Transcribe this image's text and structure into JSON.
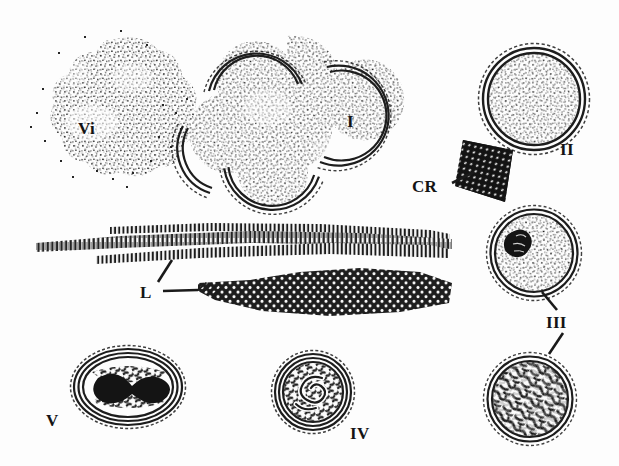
{
  "figure": {
    "background_color": "#fdfdfd",
    "ink_color": "#1a1a1a",
    "width": 619,
    "height": 466
  },
  "labels": {
    "vi": "Vi",
    "one": "I",
    "two": "II",
    "three": "III",
    "four": "IV",
    "five": "V",
    "cr": "CR",
    "l": "L"
  },
  "structures": [
    {
      "id": "vi-body",
      "label": "Vi",
      "kind": "stippled-irregular-mass",
      "description": "Irregular diffuse stippled viroplasm mass, no limiting membrane",
      "label_x": 86,
      "label_y": 128,
      "center_x": 110,
      "center_y": 115,
      "fill_texture": "fine-stipple",
      "has_membrane": false
    },
    {
      "id": "lobed-body",
      "label": "I",
      "kind": "multilobed-membraned-body",
      "description": "Large multilobed stippled inclusion with double-line membrane arcs; adjoining round lobe labelled I",
      "label_x": 352,
      "label_y": 122,
      "center_x": 290,
      "center_y": 115,
      "fill_texture": "fine-stipple",
      "has_membrane": true,
      "membrane_style": "double-arc"
    },
    {
      "id": "circle-two",
      "label": "II",
      "kind": "round-membraned-body",
      "description": "Round inclusion, concentric double membrane, uniformly fine stippled matrix",
      "label_x": 568,
      "label_y": 148,
      "center_x": 534,
      "center_y": 99,
      "radius": 51,
      "fill_texture": "fine-stipple",
      "has_membrane": true
    },
    {
      "id": "crystal",
      "label": "CR",
      "kind": "paracrystalline-array",
      "description": "Dark rhomboid paracrystal with regular lattice of light points",
      "label_x": 429,
      "label_y": 187,
      "center_x": 487,
      "center_y": 166,
      "leader_from_x": 452,
      "leader_from_y": 183,
      "leader_to_x": 472,
      "leader_to_y": 173
    },
    {
      "id": "lamellae-upper",
      "label": "L",
      "kind": "lamellar-strands",
      "description": "Long parallel striated lamellar strands spanning the middle field",
      "center_x": 230,
      "center_y": 243
    },
    {
      "id": "lamellae-lower",
      "label": "L",
      "kind": "lamellar-sheet",
      "description": "Tapered lamellar sheet with dense hexagonal sub-unit lattice",
      "center_x": 330,
      "center_y": 292
    },
    {
      "id": "label-l",
      "label": "L",
      "label_x": 148,
      "label_y": 297,
      "leader1_from_x": 163,
      "leader1_from_y": 291,
      "leader1_to_x": 196,
      "leader1_to_y": 289,
      "leader2_from_x": 158,
      "leader2_from_y": 283,
      "leader2_to_x": 172,
      "leader2_to_y": 262
    },
    {
      "id": "circle-three-upper",
      "label": "III",
      "kind": "round-membraned-body-with-inclusion",
      "description": "Round body, multiple concentric membranes, stippled matrix plus one dense dark angular inclusion",
      "center_x": 534,
      "center_y": 253,
      "radius": 44,
      "fill_texture": "fine-stipple",
      "has_dark_inclusion": true
    },
    {
      "id": "circle-three-lower",
      "label": "III",
      "kind": "round-membraned-body-dense",
      "description": "Round body, concentric membranes, filled with coarse dense tangled fibrillar texture",
      "center_x": 530,
      "center_y": 399,
      "radius": 44,
      "fill_texture": "coarse-tangle",
      "has_dark_inclusion": false
    },
    {
      "id": "label-three",
      "label": "III",
      "label_x": 557,
      "label_y": 322,
      "leader1_from_x": 556,
      "leader1_from_y": 308,
      "leader1_to_x": 542,
      "leader1_to_y": 291,
      "leader2_from_x": 562,
      "leader2_from_y": 331,
      "leader2_to_x": 549,
      "leader2_to_y": 352
    },
    {
      "id": "circle-four",
      "label": "IV",
      "kind": "round-body-with-spiral",
      "description": "Round body with several concentric rings and an internal coiled spiral of granular material",
      "label_x": 360,
      "label_y": 433,
      "center_x": 313,
      "center_y": 392,
      "radius": 41,
      "fill_texture": "coarse-granular-spiral"
    },
    {
      "id": "ellipse-five",
      "label": "V",
      "kind": "oval-body-with-dumbbell-core",
      "description": "Oval body with concentric lamellar rings enclosing a dense dumbbell shaped core",
      "label_x": 54,
      "label_y": 420,
      "center_x": 128,
      "center_y": 387,
      "radius_x": 56,
      "radius_y": 40,
      "fill_texture": "granular-with-dense-core"
    }
  ]
}
